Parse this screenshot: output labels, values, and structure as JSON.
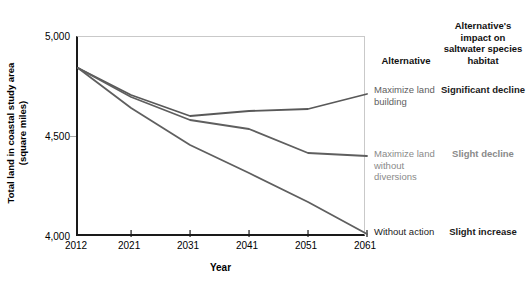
{
  "chart_data": {
    "type": "line",
    "title": "",
    "xlabel": "Year",
    "ylabel_line1": "Total land in coastal study area",
    "ylabel_line2": "(square miles)",
    "x": [
      2012,
      2021,
      2031,
      2041,
      2051,
      2061
    ],
    "xticklabels": [
      "2012",
      "2021",
      "2031",
      "2041",
      "2051",
      "2061"
    ],
    "yticklabels": [
      "5,000",
      "4,500",
      "4,000"
    ],
    "ytickvalues": [
      5000,
      4500,
      4000
    ],
    "xlim": [
      2012,
      2061
    ],
    "ylim": [
      4000,
      5000
    ],
    "grid": false,
    "legend_position": "right-annotation-table",
    "series": [
      {
        "name": "Maximize land building",
        "color": "#595959",
        "values": [
          4845,
          4710,
          4605,
          4630,
          4640,
          4715
        ]
      },
      {
        "name": "Maximize land without diversions",
        "color": "#5f5f5f",
        "values": [
          4845,
          4700,
          4585,
          4540,
          4420,
          4405
        ]
      },
      {
        "name": "Without action",
        "color": "#5f5f5f",
        "values": [
          4845,
          4645,
          4460,
          4320,
          4175,
          4015
        ]
      }
    ]
  },
  "axes": {
    "x_title": "Year",
    "y_title_line1": "Total land in coastal study area",
    "y_title_line2": "(square miles)",
    "x_ticks": [
      "2012",
      "2021",
      "2031",
      "2041",
      "2051",
      "2061"
    ],
    "y_ticks": [
      "5,000",
      "4,500",
      "4,000"
    ]
  },
  "annotation_table": {
    "headers": {
      "alternative": "Alternative",
      "impact": "Alternative's impact on saltwater species habitat"
    },
    "rows": [
      {
        "alternative": "Maximize land building",
        "impact": "Significant decline",
        "tone_alternative": "tone-mid",
        "tone_impact": "tone-dark"
      },
      {
        "alternative": "Maximize land without diversions",
        "impact": "Slight decline",
        "tone_alternative": "tone-light",
        "tone_impact": "tone-light"
      },
      {
        "alternative": "Without action",
        "impact": "Slight increase",
        "tone_alternative": "tone-dark",
        "tone_impact": "tone-dark"
      }
    ]
  },
  "colors": {
    "line": "#5f5f5f",
    "axis": "#1a1a1a",
    "frame_light": "#c9c9c9",
    "tick_light": "#a8a8a8"
  }
}
